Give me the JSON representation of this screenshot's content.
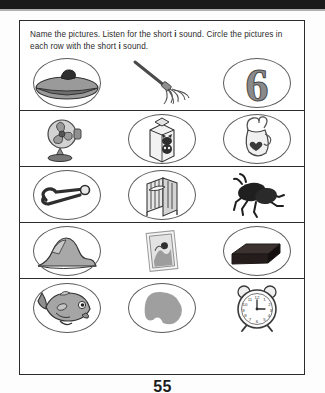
{
  "page": {
    "number": "55",
    "instructions_part1": "Name the pictures. Listen for the short ",
    "instructions_emphasis1": "i",
    "instructions_part2": " sound. Circle the pictures in each row with the short ",
    "instructions_emphasis2": "i",
    "instructions_part3": " sound."
  },
  "colors": {
    "ink": "#2b2b2b",
    "circle": "#5a5a5a",
    "gray_light": "#bdbdbd",
    "gray_mid": "#8f8f8f",
    "gray_dark": "#4a4a4a",
    "scan_bar": "#1b1b1b"
  },
  "rows": [
    {
      "index": 1,
      "cells": [
        {
          "name": "lid",
          "label": "lid",
          "circled": true
        },
        {
          "name": "mop",
          "label": "mop",
          "circled": false
        },
        {
          "name": "six",
          "label": "six",
          "circled": true,
          "glyph": "6"
        }
      ]
    },
    {
      "index": 2,
      "cells": [
        {
          "name": "fan",
          "label": "fan",
          "circled": false
        },
        {
          "name": "milk",
          "label": "milk",
          "circled": true
        },
        {
          "name": "pitcher",
          "label": "pitcher",
          "circled": true
        }
      ]
    },
    {
      "index": 3,
      "cells": [
        {
          "name": "pin",
          "label": "pin",
          "circled": true
        },
        {
          "name": "crib",
          "label": "crib",
          "circled": true
        },
        {
          "name": "bug",
          "label": "bug",
          "circled": false
        }
      ]
    },
    {
      "index": 4,
      "cells": [
        {
          "name": "hill",
          "label": "hill",
          "circled": true
        },
        {
          "name": "stamp",
          "label": "stamp",
          "circled": false
        },
        {
          "name": "brick",
          "label": "brick",
          "circled": true
        }
      ]
    },
    {
      "index": 5,
      "cells": [
        {
          "name": "fish",
          "label": "fish",
          "circled": true
        },
        {
          "name": "blob",
          "label": "blob",
          "circled": true
        },
        {
          "name": "clock",
          "label": "clock",
          "circled": false
        }
      ]
    }
  ],
  "clock": {
    "numerals": [
      "12",
      "1",
      "2",
      "3",
      "4",
      "5",
      "6",
      "7",
      "8",
      "9",
      "10",
      "11"
    ]
  }
}
